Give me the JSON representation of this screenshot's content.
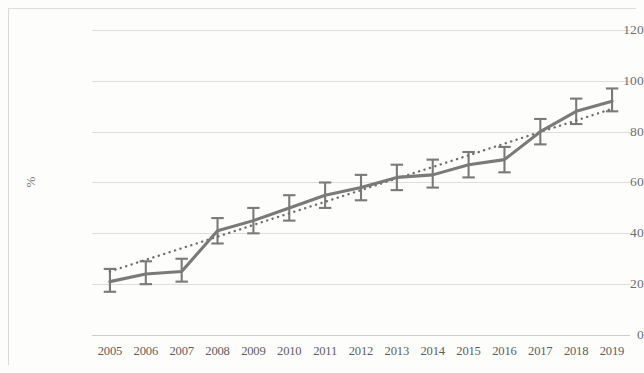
{
  "chart_data": {
    "type": "line",
    "title": "",
    "subtitle": "",
    "xlabel": "",
    "ylabel": "%",
    "categories": [
      "2005",
      "2006",
      "2007",
      "2008",
      "2009",
      "2010",
      "2011",
      "2012",
      "2013",
      "2014",
      "2015",
      "2016",
      "2017",
      "2018",
      "2019"
    ],
    "series": [
      {
        "name": "observed",
        "style": "solid",
        "color": "#7a7a7a",
        "values": [
          21,
          24,
          25,
          41,
          45,
          50,
          55,
          58,
          62,
          63,
          67,
          69,
          80,
          88,
          92
        ],
        "error_upper": [
          26,
          29,
          30,
          46,
          50,
          55,
          60,
          63,
          67,
          69,
          72,
          74,
          85,
          93,
          97
        ],
        "error_lower": [
          17,
          20,
          21,
          36,
          40,
          45,
          50,
          53,
          57,
          58,
          62,
          64,
          75,
          83,
          88
        ]
      },
      {
        "name": "trendline",
        "style": "dotted",
        "color": "#6f6f6f",
        "values": [
          25.0,
          29.6,
          34.1,
          38.7,
          43.3,
          47.9,
          52.4,
          57.0,
          61.6,
          66.1,
          70.7,
          75.3,
          79.9,
          84.4,
          89.0
        ]
      }
    ],
    "yticks": [
      0,
      20,
      40,
      60,
      80,
      100,
      120
    ],
    "ylim": [
      0,
      120
    ],
    "grid": true,
    "legend": "none"
  },
  "axis": {
    "y_tick_labels": [
      "120",
      "100",
      "80",
      "60",
      "40",
      "20",
      "0"
    ],
    "y_axis_title": "%"
  },
  "colors": {
    "series_line": "#7a7a7a",
    "trendline": "#6f6f6f",
    "gridline": "#d8d8d6",
    "tick_text": "#6e6e6e",
    "background": "#fdfdfc"
  }
}
